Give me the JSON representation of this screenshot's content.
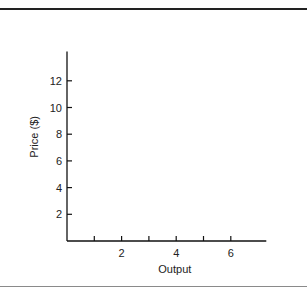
{
  "chart_data": {
    "type": "line",
    "title": "",
    "xlabel": "Output",
    "ylabel": "Price ($)",
    "xlim": [
      0,
      7.3
    ],
    "ylim": [
      0,
      14.2
    ],
    "x_ticks": [
      1,
      2,
      3,
      4,
      5,
      6
    ],
    "x_tick_labels": [
      "",
      "2",
      "",
      "4",
      "",
      "6"
    ],
    "y_ticks": [
      2,
      4,
      6,
      8,
      10,
      12
    ],
    "y_tick_labels": [
      "2",
      "4",
      "6",
      "8",
      "10",
      "12"
    ],
    "series": [],
    "grid": false,
    "legend": "none"
  }
}
